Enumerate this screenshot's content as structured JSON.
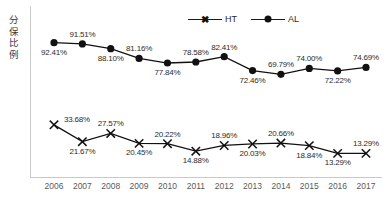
{
  "axis": {
    "y_title": "分保比例",
    "y_title_chars": [
      "分",
      "保",
      "比",
      "例"
    ]
  },
  "legend": {
    "items": [
      {
        "label": "HT",
        "marker": "x-marker",
        "color": "#111111"
      },
      {
        "label": "AL",
        "marker": "circle-marker",
        "color": "#111111"
      }
    ]
  },
  "chart_data": {
    "type": "line",
    "title": "",
    "xlabel": "",
    "ylabel": "分保比例",
    "grid": false,
    "legend_position": "top-right",
    "ylim": [
      0,
      100
    ],
    "categories": [
      "2006",
      "2007",
      "2008",
      "2009",
      "2010",
      "2011",
      "2012",
      "2013",
      "2014",
      "2015",
      "2016",
      "2017"
    ],
    "series": [
      {
        "name": "AL",
        "marker": "circle-marker",
        "values": [
          92.41,
          91.51,
          88.1,
          81.16,
          77.84,
          78.58,
          82.41,
          72.46,
          69.79,
          74.0,
          72.22,
          74.69
        ],
        "labels": [
          "92.41%",
          "91.51%",
          "88.10%",
          "81.16%",
          "77.84%",
          "78.58%",
          "82.41%",
          "72.46%",
          "69.79%",
          "74.00%",
          "72.22%",
          "74.69%"
        ],
        "label_positions": [
          "below",
          "above",
          "below",
          "above",
          "below",
          "above",
          "above",
          "below",
          "above",
          "above",
          "below",
          "above"
        ]
      },
      {
        "name": "HT",
        "marker": "x-marker",
        "values": [
          33.68,
          21.67,
          27.57,
          20.45,
          20.22,
          14.88,
          18.96,
          20.03,
          20.66,
          18.84,
          13.29,
          13.29
        ],
        "labels": [
          "33.68%",
          "21.67%",
          "27.57%",
          "20.45%",
          "20.22%",
          "14.88%",
          "18.96%",
          "20.03%",
          "20.66%",
          "18.84%",
          "13.29%",
          "13.29%"
        ],
        "label_positions": [
          "right",
          "below",
          "above",
          "below",
          "above",
          "below",
          "above",
          "below",
          "above",
          "below",
          "below",
          "above"
        ]
      }
    ]
  }
}
